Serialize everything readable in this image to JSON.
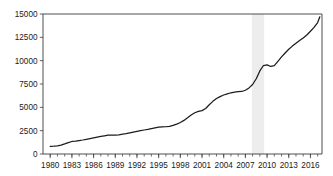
{
  "chart_data": {
    "type": "line",
    "title": "",
    "subtitle": "",
    "xlabel": "",
    "ylabel": "",
    "xlim": [
      1979.0,
      2017.6
    ],
    "ylim": [
      0,
      15000
    ],
    "grid": false,
    "legend": null,
    "y_ticks": [
      0,
      2500,
      5000,
      7500,
      10000,
      12500,
      15000
    ],
    "y_tick_labels": [
      "0",
      "2500",
      "5000",
      "7500",
      "10000",
      "12500",
      "15000"
    ],
    "x_ticks": [
      1980,
      1983,
      1986,
      1989,
      1992,
      1995,
      1998,
      2001,
      2004,
      2007,
      2010,
      2013,
      2016
    ],
    "x_tick_labels": [
      "1980",
      "1983",
      "1986",
      "1989",
      "1992",
      "1995",
      "1998",
      "2001",
      "2004",
      "2007",
      "2010",
      "2013",
      "2016"
    ],
    "x_minor_tick_step": 1,
    "x_minor_tick_start": 1980,
    "x_minor_tick_end": 2017,
    "annotations": [
      {
        "name": "recession-shading",
        "type": "vspan",
        "x_start": 2007.9,
        "x_end": 2009.6,
        "color": "#ededed"
      }
    ],
    "series": [
      {
        "name": "series-1",
        "color": "#1c1c1c",
        "x": [
          1980.0,
          1980.5,
          1981.0,
          1981.5,
          1982.0,
          1982.5,
          1983.0,
          1983.5,
          1984.0,
          1984.5,
          1985.0,
          1985.5,
          1986.0,
          1986.5,
          1987.0,
          1987.5,
          1988.0,
          1988.5,
          1989.0,
          1989.5,
          1990.0,
          1990.5,
          1991.0,
          1991.5,
          1992.0,
          1992.5,
          1993.0,
          1993.5,
          1994.0,
          1994.5,
          1995.0,
          1995.5,
          1996.0,
          1996.5,
          1997.0,
          1997.5,
          1998.0,
          1998.5,
          1999.0,
          1999.5,
          2000.0,
          2000.5,
          2001.0,
          2001.5,
          2002.0,
          2002.5,
          2003.0,
          2003.5,
          2004.0,
          2004.5,
          2005.0,
          2005.5,
          2006.0,
          2006.5,
          2007.0,
          2007.5,
          2008.0,
          2008.5,
          2009.0,
          2009.5,
          2010.0,
          2010.5,
          2011.0,
          2011.5,
          2012.0,
          2012.5,
          2013.0,
          2013.5,
          2014.0,
          2014.5,
          2015.0,
          2015.5,
          2016.0,
          2016.5,
          2017.0,
          2017.3
        ],
        "y": [
          820,
          840,
          880,
          960,
          1080,
          1220,
          1340,
          1380,
          1440,
          1500,
          1570,
          1640,
          1720,
          1800,
          1880,
          1950,
          2010,
          2030,
          2030,
          2060,
          2120,
          2190,
          2270,
          2350,
          2430,
          2500,
          2570,
          2640,
          2720,
          2800,
          2870,
          2910,
          2920,
          2960,
          3060,
          3200,
          3380,
          3600,
          3880,
          4180,
          4420,
          4560,
          4650,
          4880,
          5280,
          5640,
          5950,
          6150,
          6320,
          6450,
          6560,
          6640,
          6680,
          6700,
          6830,
          7080,
          7450,
          8060,
          8900,
          9480,
          9550,
          9380,
          9460,
          9920,
          10400,
          10820,
          11220,
          11560,
          11860,
          12150,
          12420,
          12750,
          13150,
          13560,
          14080,
          14700
        ]
      }
    ]
  },
  "plot_area": {
    "left": 43,
    "right": 322,
    "top": 14,
    "bottom": 154
  }
}
